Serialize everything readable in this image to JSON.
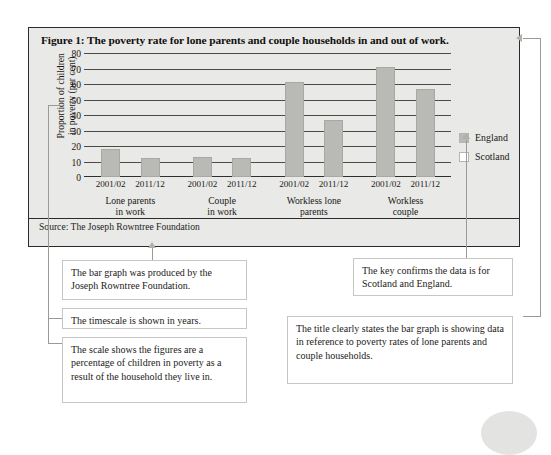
{
  "figure": {
    "title": "Figure 1: The poverty rate for lone parents and couple households in and out of work.",
    "source": "Source: The Joseph Rowntree Foundation"
  },
  "chart_data": {
    "type": "bar",
    "title": "Figure 1: The poverty rate for lone parents and couple households in and out of work.",
    "xlabel": "",
    "ylabel": "Proportion of children in poverty (per cent)",
    "ylim": [
      0,
      80
    ],
    "ytick_values": [
      "80",
      "70",
      "60",
      "50",
      "40",
      "30",
      "20",
      "10",
      "0"
    ],
    "grid": true,
    "legend_position": "right",
    "legend": [
      "England",
      "Scotland"
    ],
    "categories": [
      "2001/02",
      "2011/12",
      "2001/02",
      "2011/12",
      "2001/02",
      "2011/12",
      "2001/02",
      "2011/12"
    ],
    "values": [
      18,
      12,
      13,
      12,
      61,
      37,
      71,
      57
    ],
    "groups": [
      {
        "label": "Lone parents\nin work",
        "line1": "Lone parents",
        "line2": "in work"
      },
      {
        "label": "Couple\nin work",
        "line1": "Couple",
        "line2": "in work"
      },
      {
        "label": "Workless lone\nparents",
        "line1": "Workless lone",
        "line2": "parents"
      },
      {
        "label": "Workless\ncouple",
        "line1": "Workless",
        "line2": "couple"
      }
    ],
    "source": "Source: The Joseph Rowntree Foundation"
  },
  "yaxis": {
    "label_line1": "Proportion of children",
    "label_line2": "in poverty (per cent)"
  },
  "legend": {
    "items": [
      {
        "label": "England",
        "color": "#b9b9b5"
      },
      {
        "label": "Scotland",
        "color": "#ffffff"
      }
    ]
  },
  "xticks": [
    "2001/02",
    "2011/12",
    "2001/02",
    "2011/12",
    "2001/02",
    "2011/12",
    "2001/02",
    "2011/12"
  ],
  "groups": [
    {
      "line1": "Lone parents",
      "line2": "in work"
    },
    {
      "line1": "Couple",
      "line2": "in work"
    },
    {
      "line1": "Workless lone",
      "line2": "parents"
    },
    {
      "line1": "Workless",
      "line2": "couple"
    }
  ],
  "notes": [
    {
      "id": "note-source",
      "text": "The bar graph was produced by the Joseph Rowntree Foundation."
    },
    {
      "id": "note-timescale",
      "text": "The timescale is shown in years."
    },
    {
      "id": "note-scale",
      "text": "The scale shows the figures are a percentage of children in poverty as a result of the household they live in."
    },
    {
      "id": "note-key",
      "text": "The key confirms the data is for Scotland and England."
    },
    {
      "id": "note-title",
      "text": "The title clearly states the bar graph is showing data in reference to poverty rates of lone parents and couple households."
    }
  ],
  "colors": {
    "bar": "#b9b9b5",
    "panel_bg": "#e9e9e7",
    "panel_border": "#2b2b2b",
    "note_border": "#c6c6c4",
    "connector": "#9a9a98"
  }
}
